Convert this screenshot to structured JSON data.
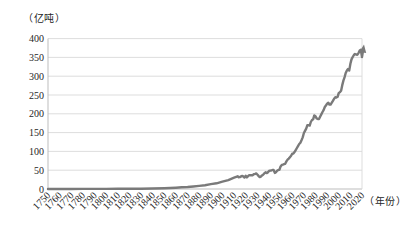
{
  "chart": {
    "y_unit_label": "（亿吨）",
    "x_unit_label": "（年份）",
    "colors": {
      "line": "#7a7a7a",
      "gridline": "#d9d9d9",
      "axis": "#bdbdbd",
      "tick_text": "#262626",
      "background": "#ffffff"
    }
  },
  "chart_data": {
    "type": "line",
    "title": "",
    "ylabel": "（亿吨）",
    "xlabel": "（年份）",
    "xlim": [
      1750,
      2020
    ],
    "ylim": [
      0,
      400
    ],
    "grid": true,
    "legend": false,
    "end_arrow": true,
    "x_ticks": [
      1750,
      1760,
      1770,
      1780,
      1790,
      1800,
      1810,
      1820,
      1830,
      1840,
      1850,
      1860,
      1870,
      1880,
      1890,
      1900,
      1910,
      1920,
      1930,
      1940,
      1950,
      1960,
      1970,
      1980,
      1990,
      2000,
      2010,
      2020
    ],
    "y_ticks": [
      0,
      50,
      100,
      150,
      200,
      250,
      300,
      350,
      400
    ],
    "series": [
      {
        "points": [
          [
            1750,
            0.1
          ],
          [
            1760,
            0.1
          ],
          [
            1770,
            0.1
          ],
          [
            1780,
            0.2
          ],
          [
            1790,
            0.3
          ],
          [
            1800,
            0.3
          ],
          [
            1810,
            0.4
          ],
          [
            1820,
            0.5
          ],
          [
            1830,
            0.8
          ],
          [
            1840,
            1.2
          ],
          [
            1850,
            2.0
          ],
          [
            1855,
            2.7
          ],
          [
            1860,
            3.4
          ],
          [
            1865,
            4.4
          ],
          [
            1870,
            5.3
          ],
          [
            1875,
            6.6
          ],
          [
            1880,
            8.2
          ],
          [
            1885,
            10.2
          ],
          [
            1890,
            13.0
          ],
          [
            1895,
            15.2
          ],
          [
            1900,
            19.5
          ],
          [
            1905,
            23.7
          ],
          [
            1910,
            30.0
          ],
          [
            1913,
            33.9
          ],
          [
            1914,
            31.4
          ],
          [
            1915,
            31.7
          ],
          [
            1916,
            33.6
          ],
          [
            1917,
            34.5
          ],
          [
            1918,
            33.8
          ],
          [
            1919,
            30.3
          ],
          [
            1920,
            35.1
          ],
          [
            1921,
            30.9
          ],
          [
            1922,
            34.1
          ],
          [
            1923,
            36.6
          ],
          [
            1924,
            36.8
          ],
          [
            1925,
            36.9
          ],
          [
            1926,
            36.4
          ],
          [
            1927,
            39.6
          ],
          [
            1928,
            39.8
          ],
          [
            1929,
            41.6
          ],
          [
            1930,
            38.6
          ],
          [
            1931,
            34.9
          ],
          [
            1932,
            31.6
          ],
          [
            1933,
            33.1
          ],
          [
            1934,
            36.3
          ],
          [
            1935,
            38.0
          ],
          [
            1936,
            41.4
          ],
          [
            1937,
            44.5
          ],
          [
            1938,
            42.4
          ],
          [
            1939,
            44.1
          ],
          [
            1940,
            47.8
          ],
          [
            1941,
            49.0
          ],
          [
            1942,
            49.3
          ],
          [
            1943,
            50.5
          ],
          [
            1944,
            50.7
          ],
          [
            1945,
            42.8
          ],
          [
            1946,
            44.6
          ],
          [
            1947,
            48.6
          ],
          [
            1948,
            50.9
          ],
          [
            1949,
            50.7
          ],
          [
            1950,
            60.0
          ],
          [
            1951,
            64.2
          ],
          [
            1952,
            64.9
          ],
          [
            1953,
            66.1
          ],
          [
            1954,
            67.0
          ],
          [
            1955,
            73.5
          ],
          [
            1956,
            78.1
          ],
          [
            1957,
            80.8
          ],
          [
            1958,
            84.5
          ],
          [
            1959,
            88.3
          ],
          [
            1960,
            94.0
          ],
          [
            1961,
            94.5
          ],
          [
            1962,
            98.1
          ],
          [
            1963,
            103.5
          ],
          [
            1964,
            109.1
          ],
          [
            1965,
            114.0
          ],
          [
            1966,
            119.6
          ],
          [
            1967,
            123.2
          ],
          [
            1968,
            129.6
          ],
          [
            1969,
            137.2
          ],
          [
            1970,
            149.0
          ],
          [
            1971,
            154.6
          ],
          [
            1972,
            160.6
          ],
          [
            1973,
            169.3
          ],
          [
            1974,
            169.6
          ],
          [
            1975,
            168.5
          ],
          [
            1976,
            178.2
          ],
          [
            1977,
            183.6
          ],
          [
            1978,
            185.6
          ],
          [
            1979,
            195.8
          ],
          [
            1980,
            193.7
          ],
          [
            1981,
            187.8
          ],
          [
            1982,
            186.3
          ],
          [
            1983,
            185.8
          ],
          [
            1984,
            192.3
          ],
          [
            1985,
            198.5
          ],
          [
            1986,
            204.9
          ],
          [
            1987,
            209.9
          ],
          [
            1988,
            218.0
          ],
          [
            1989,
            221.7
          ],
          [
            1990,
            227.1
          ],
          [
            1991,
            229.6
          ],
          [
            1992,
            224.7
          ],
          [
            1993,
            224.6
          ],
          [
            1994,
            229.4
          ],
          [
            1995,
            234.3
          ],
          [
            1996,
            240.2
          ],
          [
            1997,
            244.0
          ],
          [
            1998,
            243.3
          ],
          [
            1999,
            245.1
          ],
          [
            2000,
            255.1
          ],
          [
            2001,
            257.6
          ],
          [
            2002,
            261.1
          ],
          [
            2003,
            275.4
          ],
          [
            2004,
            288.3
          ],
          [
            2005,
            297.7
          ],
          [
            2006,
            308.4
          ],
          [
            2007,
            315.1
          ],
          [
            2008,
            318.9
          ],
          [
            2009,
            315.0
          ],
          [
            2010,
            333.1
          ],
          [
            2011,
            344.8
          ],
          [
            2012,
            351.0
          ],
          [
            2013,
            356.3
          ],
          [
            2014,
            359.1
          ],
          [
            2015,
            357.8
          ],
          [
            2016,
            357.2
          ],
          [
            2017,
            361.4
          ],
          [
            2018,
            368.4
          ],
          [
            2019,
            370.3
          ],
          [
            2020,
            351.0
          ],
          [
            2021,
            371.0
          ]
        ]
      }
    ]
  }
}
